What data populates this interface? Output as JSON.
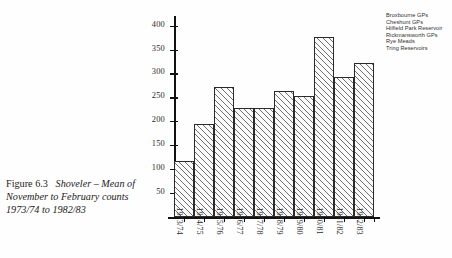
{
  "caption": {
    "figure_label": "Figure 6.3",
    "title_line1": "Shoveler – Mean of",
    "title_line2": "November to February counts",
    "title_line3": "1973/74 to 1982/83"
  },
  "legend": {
    "items": [
      "Broxbourne GPs",
      "Cheshunt GPs",
      "Hilfield Park Reservoir",
      "Rickmansworth GPs",
      "Rye Meads",
      "Tring Reservoirs"
    ]
  },
  "chart_data": {
    "type": "bar",
    "title": "Shoveler – Mean of November to February counts 1973/74 to 1982/83",
    "xlabel": "",
    "ylabel": "",
    "categories": [
      "1973/74",
      "1974/75",
      "1975/76",
      "1976/77",
      "1977/78",
      "1978/79",
      "1979/80",
      "1980/81",
      "1981/82",
      "1982/83"
    ],
    "values": [
      118,
      194,
      271,
      227,
      227,
      264,
      253,
      377,
      293,
      322
    ],
    "yticks": [
      50,
      100,
      150,
      200,
      250,
      300,
      350,
      400
    ],
    "ylim": [
      0,
      420
    ],
    "grid": false,
    "legend_position": "top-right",
    "series_names": [
      "Broxbourne GPs",
      "Cheshunt GPs",
      "Hilfield Park Reservoir",
      "Rickmansworth GPs",
      "Rye Meads",
      "Tring Reservoirs"
    ],
    "bar_fill": "diagonal-hatch",
    "colors": {
      "axis": "#111111",
      "bar_outline": "#2a2a2a",
      "hatch": "#6f6f6f",
      "text": "#2b2b2b",
      "background": "#ffffff"
    }
  }
}
